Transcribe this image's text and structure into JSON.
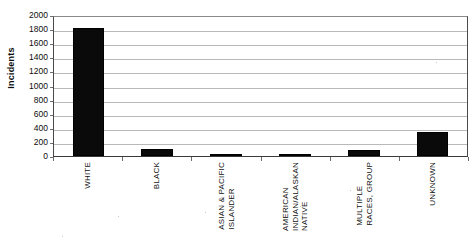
{
  "chart_data": {
    "type": "bar",
    "title": "",
    "xlabel": "",
    "ylabel": "Incidents",
    "ylim": [
      0,
      2000
    ],
    "ytick_step": 200,
    "yticks": [
      2000,
      1800,
      1600,
      1400,
      1200,
      1000,
      800,
      600,
      400,
      200,
      0
    ],
    "grid": true,
    "legend": "none",
    "bar_color": "#000000",
    "gridline_color": "#b9b9b9",
    "categories": [
      "WHITE",
      "BLACK",
      "ASIAN & PACIFIC ISLANDER",
      "AMERICAN INDIAN/ALASKAN NATIVE",
      "MULTIPLE RACES, GROUP",
      "UNKNOWN"
    ],
    "category_lines": [
      [
        "WHITE"
      ],
      [
        "BLACK"
      ],
      [
        "ASIAN & PACIFIC",
        "ISLANDER"
      ],
      [
        "AMERICAN",
        "INDIAN/ALASKAN",
        "NATIVE"
      ],
      [
        "MULTIPLE",
        "RACES, GROUP"
      ],
      [
        "UNKNOWN"
      ]
    ],
    "values": [
      1820,
      95,
      10,
      20,
      80,
      340
    ]
  }
}
